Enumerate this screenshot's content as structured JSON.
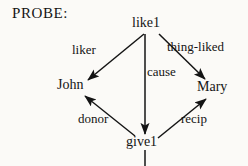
{
  "figure": {
    "probe_label": "PROBE:",
    "background_color": "#fbfaf7",
    "ink_color": "#141414"
  },
  "nodes": [
    {
      "id": "like1",
      "label": "like1",
      "x": 150,
      "y": 25
    },
    {
      "id": "john",
      "label": "John",
      "x": 76,
      "y": 87
    },
    {
      "id": "mary",
      "label": "Mary",
      "x": 215,
      "y": 89
    },
    {
      "id": "give1",
      "label": "give1",
      "x": 145,
      "y": 144
    }
  ],
  "edges": [
    {
      "id": "liker",
      "label": "liker",
      "from": "like1",
      "to": "john",
      "label_x": 89,
      "label_y": 51
    },
    {
      "id": "thing-liked",
      "label": "thing-liked",
      "from": "like1",
      "to": "mary",
      "label_x": 204,
      "label_y": 48
    },
    {
      "id": "cause",
      "label": "cause",
      "from": "like1",
      "to": "give1",
      "label_x": 162,
      "label_y": 73
    },
    {
      "id": "donor",
      "label": "donor",
      "from": "give1",
      "to": "john",
      "label_x": 100,
      "label_y": 120
    },
    {
      "id": "recip",
      "label": "recip",
      "from": "give1",
      "to": "mary",
      "label_x": 196,
      "label_y": 120
    }
  ],
  "stub_edge": {
    "id": "give1-stem",
    "from": "give1",
    "description": "vertical line descending from give1 to bottom edge"
  }
}
